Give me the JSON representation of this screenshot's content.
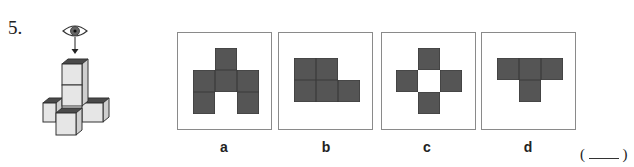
{
  "question": {
    "number": "5.",
    "answer_open": "(",
    "answer_close": ")"
  },
  "figure": {
    "icons": [
      "eye-icon",
      "arrow-down-icon"
    ]
  },
  "options": [
    {
      "label": "a",
      "grid": [
        [
          0,
          1,
          0
        ],
        [
          1,
          1,
          1
        ],
        [
          1,
          0,
          1
        ]
      ]
    },
    {
      "label": "b",
      "grid": [
        [
          1,
          1,
          0
        ],
        [
          1,
          1,
          1
        ]
      ]
    },
    {
      "label": "c",
      "grid": [
        [
          0,
          1,
          0
        ],
        [
          1,
          0,
          1
        ],
        [
          0,
          1,
          0
        ]
      ]
    },
    {
      "label": "d",
      "grid": [
        [
          1,
          1,
          1
        ],
        [
          0,
          1,
          0
        ]
      ]
    }
  ],
  "colors": {
    "square_fill": "#555555",
    "box_border": "#8a8a8a",
    "cube_top": "#4a4a4a",
    "cube_face": "#e6e6e6"
  }
}
